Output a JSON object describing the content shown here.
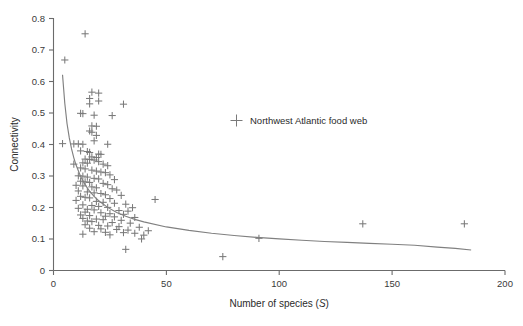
{
  "chart_data": {
    "type": "scatter",
    "title": "",
    "xlabel": "Number of species (S)",
    "xlabel_plain": "Number of species (",
    "xlabel_italic": "S",
    "xlabel_close": ")",
    "ylabel": "Connectivity",
    "xlim": [
      0,
      200
    ],
    "ylim": [
      0,
      0.8
    ],
    "xticks": [
      0,
      50,
      100,
      150,
      200
    ],
    "xtick_labels": [
      "0",
      "50",
      "100",
      "150",
      "200"
    ],
    "yticks": [
      0,
      0.1,
      0.2,
      0.3,
      0.4,
      0.5,
      0.6,
      0.7,
      0.8
    ],
    "ytick_labels": [
      "0",
      "0.1",
      "0.2",
      "0.3",
      "0.4",
      "0.5",
      "0.6",
      "0.7",
      "0.8"
    ],
    "grid": false,
    "legend_position": "inside-upper-right",
    "marker_symbol": "plus",
    "marker_color": "#7a7a7a",
    "curve_color": "#808080",
    "axis_color": "#6b6b6b",
    "series": [
      {
        "name": "Northwest Atlantic food web",
        "marker": "plus",
        "points": [
          [
            14,
            0.75
          ],
          [
            5,
            0.667
          ],
          [
            17,
            0.565
          ],
          [
            20,
            0.562
          ],
          [
            16,
            0.545
          ],
          [
            20,
            0.537
          ],
          [
            31,
            0.527
          ],
          [
            16,
            0.528
          ],
          [
            12,
            0.498
          ],
          [
            13,
            0.497
          ],
          [
            18,
            0.492
          ],
          [
            26,
            0.491
          ],
          [
            17,
            0.458
          ],
          [
            19,
            0.457
          ],
          [
            16,
            0.442
          ],
          [
            17,
            0.438
          ],
          [
            19,
            0.428
          ],
          [
            18,
            0.411
          ],
          [
            4,
            0.402
          ],
          [
            9,
            0.401
          ],
          [
            11,
            0.401
          ],
          [
            13,
            0.4
          ],
          [
            24,
            0.4
          ],
          [
            12,
            0.379
          ],
          [
            15,
            0.377
          ],
          [
            16,
            0.374
          ],
          [
            20,
            0.369
          ],
          [
            21,
            0.368
          ],
          [
            17,
            0.36
          ],
          [
            19,
            0.358
          ],
          [
            9,
            0.337
          ],
          [
            14,
            0.353
          ],
          [
            16,
            0.352
          ],
          [
            18,
            0.35
          ],
          [
            20,
            0.345
          ],
          [
            13,
            0.341
          ],
          [
            15,
            0.34
          ],
          [
            22,
            0.337
          ],
          [
            24,
            0.332
          ],
          [
            12,
            0.325
          ],
          [
            14,
            0.322
          ],
          [
            17,
            0.318
          ],
          [
            19,
            0.315
          ],
          [
            21,
            0.312
          ],
          [
            23,
            0.31
          ],
          [
            25,
            0.303
          ],
          [
            11,
            0.3
          ],
          [
            13,
            0.299
          ],
          [
            15,
            0.296
          ],
          [
            18,
            0.292
          ],
          [
            20,
            0.29
          ],
          [
            27,
            0.288
          ],
          [
            12,
            0.283
          ],
          [
            14,
            0.281
          ],
          [
            16,
            0.279
          ],
          [
            22,
            0.276
          ],
          [
            24,
            0.272
          ],
          [
            10,
            0.27
          ],
          [
            13,
            0.268
          ],
          [
            17,
            0.265
          ],
          [
            19,
            0.262
          ],
          [
            26,
            0.259
          ],
          [
            28,
            0.255
          ],
          [
            11,
            0.252
          ],
          [
            15,
            0.249
          ],
          [
            18,
            0.246
          ],
          [
            21,
            0.244
          ],
          [
            23,
            0.24
          ],
          [
            30,
            0.238
          ],
          [
            12,
            0.235
          ],
          [
            14,
            0.232
          ],
          [
            16,
            0.23
          ],
          [
            25,
            0.228
          ],
          [
            45,
            0.225
          ],
          [
            10,
            0.222
          ],
          [
            19,
            0.219
          ],
          [
            22,
            0.216
          ],
          [
            27,
            0.213
          ],
          [
            32,
            0.21
          ],
          [
            13,
            0.208
          ],
          [
            17,
            0.206
          ],
          [
            20,
            0.203
          ],
          [
            24,
            0.2
          ],
          [
            35,
            0.199
          ],
          [
            11,
            0.197
          ],
          [
            15,
            0.194
          ],
          [
            18,
            0.192
          ],
          [
            29,
            0.19
          ],
          [
            33,
            0.188
          ],
          [
            14,
            0.185
          ],
          [
            21,
            0.183
          ],
          [
            25,
            0.18
          ],
          [
            31,
            0.178
          ],
          [
            12,
            0.176
          ],
          [
            16,
            0.174
          ],
          [
            23,
            0.172
          ],
          [
            27,
            0.17
          ],
          [
            36,
            0.168
          ],
          [
            13,
            0.165
          ],
          [
            19,
            0.163
          ],
          [
            22,
            0.161
          ],
          [
            30,
            0.159
          ],
          [
            15,
            0.157
          ],
          [
            17,
            0.155
          ],
          [
            26,
            0.152
          ],
          [
            34,
            0.15
          ],
          [
            137,
            0.148
          ],
          [
            182,
            0.148
          ],
          [
            14,
            0.145
          ],
          [
            20,
            0.143
          ],
          [
            24,
            0.141
          ],
          [
            29,
            0.139
          ],
          [
            38,
            0.137
          ],
          [
            16,
            0.134
          ],
          [
            21,
            0.132
          ],
          [
            28,
            0.13
          ],
          [
            33,
            0.128
          ],
          [
            42,
            0.126
          ],
          [
            18,
            0.123
          ],
          [
            23,
            0.121
          ],
          [
            31,
            0.12
          ],
          [
            36,
            0.118
          ],
          [
            13,
            0.115
          ],
          [
            25,
            0.113
          ],
          [
            40,
            0.112
          ],
          [
            91,
            0.102
          ],
          [
            39,
            0.1
          ],
          [
            32,
            0.067
          ],
          [
            75,
            0.044
          ]
        ]
      }
    ],
    "fit_curve": {
      "description": "power-law decay fit",
      "x_start": 4,
      "x_end": 185,
      "y_start": 0.62,
      "y_end": 0.065,
      "points": [
        [
          4,
          0.62
        ],
        [
          5,
          0.53
        ],
        [
          6,
          0.465
        ],
        [
          7,
          0.42
        ],
        [
          8,
          0.385
        ],
        [
          9,
          0.357
        ],
        [
          10,
          0.334
        ],
        [
          12,
          0.298
        ],
        [
          14,
          0.272
        ],
        [
          16,
          0.251
        ],
        [
          18,
          0.235
        ],
        [
          20,
          0.221
        ],
        [
          24,
          0.2
        ],
        [
          28,
          0.184
        ],
        [
          32,
          0.172
        ],
        [
          36,
          0.162
        ],
        [
          40,
          0.154
        ],
        [
          50,
          0.138
        ],
        [
          60,
          0.127
        ],
        [
          70,
          0.118
        ],
        [
          80,
          0.111
        ],
        [
          90,
          0.105
        ],
        [
          100,
          0.1
        ],
        [
          110,
          0.096
        ],
        [
          120,
          0.092
        ],
        [
          130,
          0.089
        ],
        [
          140,
          0.086
        ],
        [
          150,
          0.083
        ],
        [
          160,
          0.08
        ],
        [
          170,
          0.074
        ],
        [
          178,
          0.07
        ],
        [
          185,
          0.065
        ]
      ]
    },
    "legend": [
      {
        "label": "Northwest Atlantic food web",
        "marker": "plus",
        "color": "#7a7a7a"
      }
    ]
  }
}
